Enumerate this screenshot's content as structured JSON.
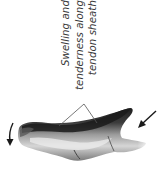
{
  "figure": {
    "annotation": {
      "lines": [
        "Swelling and",
        "tenderness along",
        "tendon sheath"
      ]
    },
    "arrows": [
      {
        "name": "fingertip-direction-arrow",
        "direction": "down"
      },
      {
        "name": "base-direction-arrow",
        "direction": "down-left"
      }
    ],
    "colors": {
      "ink": "#1a1a1a",
      "shade_dark": "#2b2b2b",
      "shade_mid": "#8a8a8a",
      "shade_light": "#d9d9d9",
      "leader": "#555555"
    }
  }
}
